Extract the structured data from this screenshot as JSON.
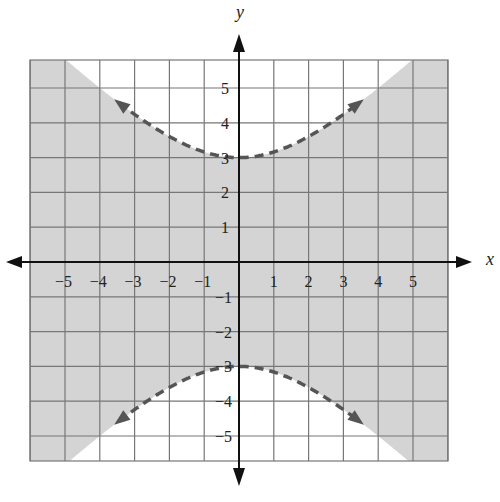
{
  "chart_data": {
    "type": "line",
    "title": "",
    "xlabel": "x",
    "ylabel": "y",
    "xlim": [
      -6,
      6
    ],
    "ylim": [
      -5.7,
      5.8
    ],
    "grid": true,
    "x_ticks": [
      -5,
      -4,
      -3,
      -2,
      -1,
      1,
      2,
      3,
      4,
      5
    ],
    "y_ticks": [
      -5,
      -4,
      -3,
      -2,
      -1,
      1,
      2,
      3,
      4,
      5
    ],
    "x_tick_labels": [
      "−5",
      "−4",
      "−3",
      "−2",
      "−1",
      "1",
      "2",
      "3",
      "4",
      "5"
    ],
    "y_tick_labels": [
      "−5",
      "−4",
      "−3",
      "−2",
      "−1",
      "1",
      "2",
      "3",
      "4",
      "5"
    ],
    "series": [
      {
        "name": "upper branch",
        "style": "dashed",
        "color": "#555555",
        "equation": "y = sqrt(9 + x^2)",
        "x": [
          -3.4,
          -3,
          -2,
          -1,
          0,
          1,
          2,
          3,
          3.4
        ],
        "y": [
          4.53,
          4.24,
          3.61,
          3.16,
          3.0,
          3.16,
          3.61,
          4.24,
          4.53
        ]
      },
      {
        "name": "lower branch",
        "style": "dashed",
        "color": "#555555",
        "equation": "y = -sqrt(9 + x^2)",
        "x": [
          -3.4,
          -3,
          -2,
          -1,
          0,
          1,
          2,
          3,
          3.4
        ],
        "y": [
          -4.53,
          -4.24,
          -3.61,
          -3.16,
          -3.0,
          -3.16,
          -3.61,
          -4.24,
          -4.53
        ]
      }
    ],
    "shaded_region": {
      "description": "Region between the two hyperbola branches (|y| < sqrt(9 + x^2))",
      "color": "#d4d4d4"
    },
    "vertices": [
      [
        0,
        3
      ],
      [
        0,
        -3
      ]
    ]
  },
  "colors": {
    "shade": "#d4d4d4",
    "grid": "#777777",
    "axis": "#111111",
    "curve": "#555555"
  },
  "axes": {
    "x_label": "x",
    "y_label": "y"
  }
}
